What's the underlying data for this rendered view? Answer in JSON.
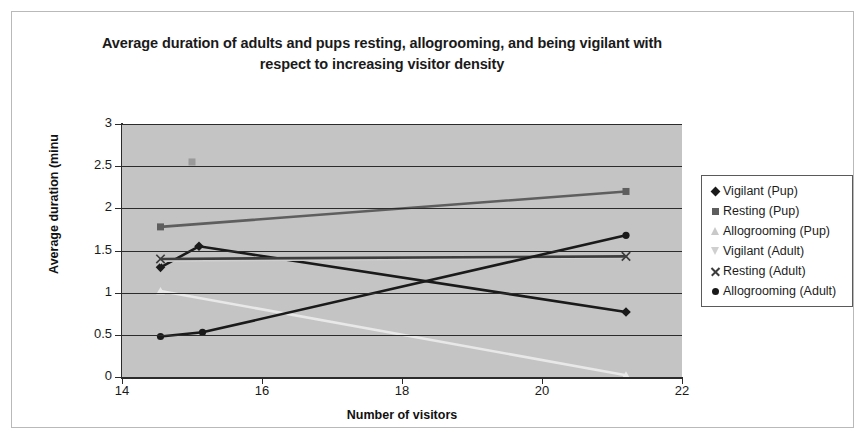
{
  "chart_data": {
    "type": "line",
    "title": "Average duration of adults and pups resting, allogrooming, and being vigilant with respect to increasing visitor density",
    "title_line1": "Average duration of adults and pups resting, allogrooming, and being",
    "title_line2": "vigilant with respect to increasing visitor density",
    "xlabel": "Number of visitors",
    "ylabel": "Average duration (minu",
    "xlim": [
      14,
      22
    ],
    "ylim": [
      0,
      3
    ],
    "xticks": [
      14,
      16,
      18,
      20,
      22
    ],
    "yticks": [
      0,
      0.5,
      1,
      1.5,
      2,
      2.5,
      3
    ],
    "xtick_labels": [
      "14",
      "16",
      "18",
      "20",
      "22"
    ],
    "ytick_labels": [
      "0",
      "0.5",
      "1",
      "1.5",
      "2",
      "2.5",
      "3"
    ],
    "grid": "horizontal",
    "plot_background": "#c4c4c4",
    "legend_position": "right",
    "series": [
      {
        "name": "Vigilant (Pup)",
        "marker": "diamond",
        "color": "#1a1a1a",
        "x": [
          14.55,
          15.1,
          21.2
        ],
        "y": [
          1.3,
          1.55,
          0.77
        ]
      },
      {
        "name": "Resting (Pup)",
        "marker": "square",
        "color": "#5e5e5e",
        "x": [
          14.55,
          21.2
        ],
        "y": [
          1.78,
          2.2
        ]
      },
      {
        "name": "Allogrooming (Pup)",
        "marker": "triangle",
        "color": "#e8e8e8",
        "x": [
          14.55,
          21.2
        ],
        "y": [
          1.02,
          0.02
        ]
      },
      {
        "name": "Vigilant (Adult)",
        "marker": "triangle-down",
        "color": "#cfcfcf",
        "x": [
          14.55,
          21.2
        ],
        "y": [
          1.38,
          1.42
        ]
      },
      {
        "name": "Resting (Adult)",
        "marker": "x",
        "color": "#3d3d3d",
        "x": [
          14.55,
          21.2
        ],
        "y": [
          1.4,
          1.43
        ]
      },
      {
        "name": "Allogrooming (Adult)",
        "marker": "circle",
        "color": "#1a1a1a",
        "x": [
          14.55,
          15.15,
          21.2
        ],
        "y": [
          0.48,
          0.53,
          1.68
        ]
      }
    ],
    "stray_points": [
      {
        "series": "Resting (Pup)",
        "x": 15.0,
        "y": 2.55,
        "color": "#9a9a9a"
      }
    ]
  }
}
